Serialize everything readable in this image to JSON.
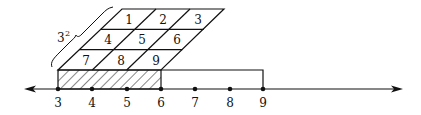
{
  "diagram": {
    "colors": {
      "ink": "#111111",
      "background": "#ffffff"
    },
    "number_line": {
      "ticks": [
        {
          "value": 3,
          "label": "3",
          "x": 58
        },
        {
          "value": 4,
          "label": "4",
          "x": 92
        },
        {
          "value": 5,
          "label": "5",
          "x": 127
        },
        {
          "value": 6,
          "label": "6",
          "x": 161
        },
        {
          "value": 7,
          "label": "7",
          "x": 195
        },
        {
          "value": 8,
          "label": "8",
          "x": 230
        },
        {
          "value": 9,
          "label": "9",
          "x": 263
        }
      ],
      "arrows": [
        "left",
        "right"
      ]
    },
    "grid": {
      "rows": 3,
      "cols": 3,
      "cells": [
        "1",
        "2",
        "3",
        "4",
        "5",
        "6",
        "7",
        "8",
        "9"
      ]
    },
    "brace_label": {
      "base": "3",
      "exponent": "2"
    },
    "hatched_segment": {
      "from": 3,
      "to": 6
    },
    "open_segment": {
      "from": 6,
      "to": 9
    }
  }
}
